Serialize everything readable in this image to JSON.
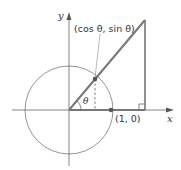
{
  "diagram": {
    "labels": {
      "x_axis": "x",
      "y_axis": "y",
      "point_on_circle": "(cos θ, sin θ)",
      "unit_point": "(1, 0)",
      "angle": "θ"
    },
    "colors": {
      "line": "#6b6b6b",
      "thick_line": "#7a7a7a",
      "point": "#555555",
      "text": "#333333"
    }
  }
}
